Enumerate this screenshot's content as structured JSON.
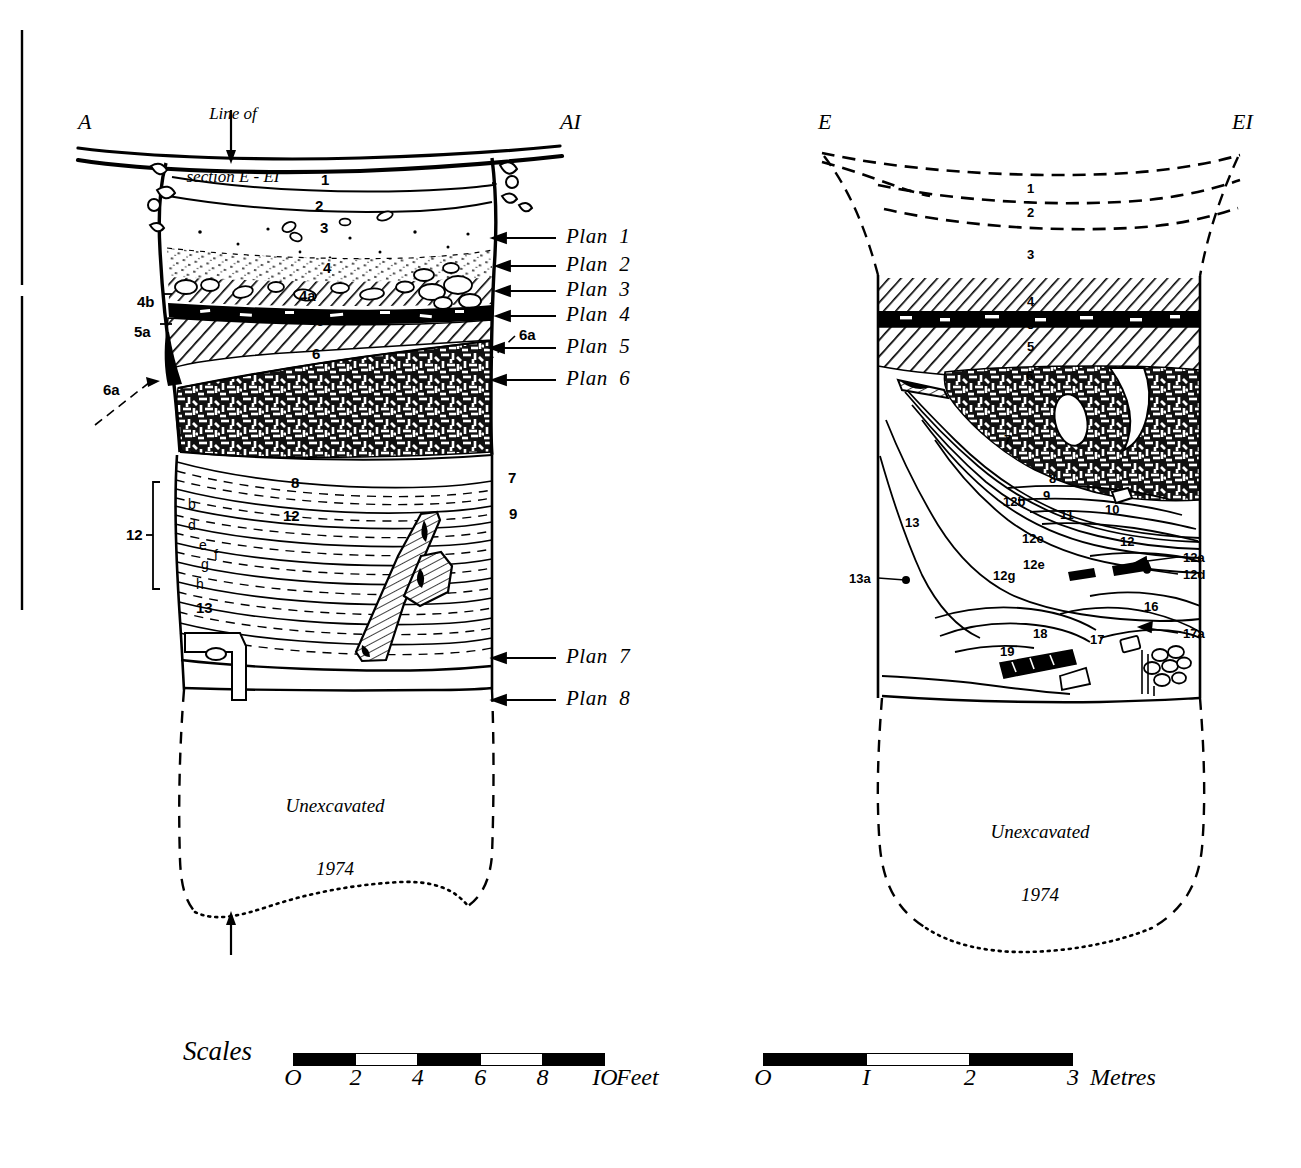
{
  "figure": {
    "title_note": "Line of\nsection E - EI",
    "line_of_section_l1": "Line of",
    "line_of_section_l2": "section E - EI"
  },
  "left_section": {
    "left_letter": "A",
    "right_letter": "AI",
    "caption_line1": "Unexcavated",
    "caption_line2": "1974",
    "bracket_label": "12",
    "strata_labels": [
      {
        "id": "l-1",
        "text": "1",
        "x": 321,
        "y": 172
      },
      {
        "id": "l-2",
        "text": "2",
        "x": 315,
        "y": 198
      },
      {
        "id": "l-3",
        "text": "3",
        "x": 320,
        "y": 220
      },
      {
        "id": "l-4",
        "text": "4",
        "x": 323,
        "y": 260
      },
      {
        "id": "l-4a",
        "text": "4a",
        "x": 299,
        "y": 288
      },
      {
        "id": "l-4b",
        "text": "4b",
        "x": 137,
        "y": 294
      },
      {
        "id": "l-5",
        "text": "5",
        "x": 316,
        "y": 313
      },
      {
        "id": "l-5a",
        "text": "5a",
        "x": 134,
        "y": 324
      },
      {
        "id": "l-6",
        "text": "6",
        "x": 312,
        "y": 346
      },
      {
        "id": "l-6a-top",
        "text": "6a",
        "x": 519,
        "y": 327
      },
      {
        "id": "l-6a-left",
        "text": "6a",
        "x": 103,
        "y": 382
      },
      {
        "id": "l-7",
        "text": "7",
        "x": 508,
        "y": 470
      },
      {
        "id": "l-8",
        "text": "8",
        "x": 291,
        "y": 475
      },
      {
        "id": "l-9",
        "text": "9",
        "x": 509,
        "y": 506
      },
      {
        "id": "l-12",
        "text": "12",
        "x": 283,
        "y": 508
      },
      {
        "id": "l-13",
        "text": "13",
        "x": 196,
        "y": 600
      }
    ],
    "sub_layers": [
      {
        "id": "sub-b",
        "text": "b",
        "x": 188,
        "y": 497
      },
      {
        "id": "sub-d",
        "text": "d",
        "x": 188,
        "y": 518
      },
      {
        "id": "sub-e",
        "text": "e",
        "x": 199,
        "y": 538
      },
      {
        "id": "sub-f",
        "text": "f",
        "x": 214,
        "y": 548
      },
      {
        "id": "sub-g",
        "text": "g",
        "x": 201,
        "y": 557
      },
      {
        "id": "sub-h",
        "text": "h",
        "x": 196,
        "y": 577
      }
    ],
    "plan_callouts": [
      {
        "id": "plan-1",
        "label": "Plan  1",
        "y": 238
      },
      {
        "id": "plan-2",
        "label": "Plan  2",
        "y": 266
      },
      {
        "id": "plan-3",
        "label": "Plan  3",
        "y": 291
      },
      {
        "id": "plan-4",
        "label": "Plan  4",
        "y": 316
      },
      {
        "id": "plan-5",
        "label": "Plan  5",
        "y": 348
      },
      {
        "id": "plan-6",
        "label": "Plan  6",
        "y": 380
      },
      {
        "id": "plan-7",
        "label": "Plan  7",
        "y": 658
      },
      {
        "id": "plan-8",
        "label": "Plan  8",
        "y": 700
      }
    ]
  },
  "right_section": {
    "left_letter": "E",
    "right_letter": "EI",
    "caption_line1": "Unexcavated",
    "caption_line2": "1974",
    "strata_labels": [
      {
        "id": "r-1",
        "text": "1",
        "x": 1027,
        "y": 182
      },
      {
        "id": "r-2",
        "text": "2",
        "x": 1027,
        "y": 206
      },
      {
        "id": "r-3",
        "text": "3",
        "x": 1027,
        "y": 248
      },
      {
        "id": "r-4",
        "text": "4",
        "x": 1027,
        "y": 295
      },
      {
        "id": "r-5a",
        "text": "5",
        "x": 1027,
        "y": 318
      },
      {
        "id": "r-5b",
        "text": "5",
        "x": 1027,
        "y": 340
      },
      {
        "id": "r-6",
        "text": "6",
        "x": 1026,
        "y": 369
      },
      {
        "id": "r-7",
        "text": "7",
        "x": 1004,
        "y": 433
      },
      {
        "id": "r-8",
        "text": "8",
        "x": 1049,
        "y": 472
      },
      {
        "id": "r-9",
        "text": "9",
        "x": 1043,
        "y": 489
      },
      {
        "id": "r-10",
        "text": "10",
        "x": 1105,
        "y": 503
      },
      {
        "id": "r-11",
        "text": "11",
        "x": 1060,
        "y": 508
      },
      {
        "id": "r-12",
        "text": "12",
        "x": 1120,
        "y": 535
      },
      {
        "id": "r-12b",
        "text": "12b",
        "x": 1003,
        "y": 495
      },
      {
        "id": "r-12e1",
        "text": "12e",
        "x": 1022,
        "y": 532
      },
      {
        "id": "r-12e2",
        "text": "12e",
        "x": 1023,
        "y": 558
      },
      {
        "id": "r-12g",
        "text": "12g",
        "x": 993,
        "y": 569
      },
      {
        "id": "r-12a",
        "text": "12a",
        "x": 1183,
        "y": 551
      },
      {
        "id": "r-12d",
        "text": "12d",
        "x": 1183,
        "y": 568
      },
      {
        "id": "r-13",
        "text": "13",
        "x": 905,
        "y": 516
      },
      {
        "id": "r-13a",
        "text": "13a",
        "x": 849,
        "y": 572
      },
      {
        "id": "r-16",
        "text": "16",
        "x": 1144,
        "y": 600
      },
      {
        "id": "r-17",
        "text": "17",
        "x": 1090,
        "y": 633
      },
      {
        "id": "r-17a",
        "text": "17a",
        "x": 1183,
        "y": 627
      },
      {
        "id": "r-18",
        "text": "18",
        "x": 1033,
        "y": 627
      },
      {
        "id": "r-19",
        "text": "19",
        "x": 1000,
        "y": 645
      }
    ]
  },
  "scales": {
    "word": "Scales",
    "feet": {
      "ticks": [
        "O",
        "2",
        "4",
        "6",
        "8",
        "IO"
      ],
      "unit": "Feet",
      "segments": [
        "black",
        "white",
        "black",
        "white",
        "black"
      ]
    },
    "metres": {
      "ticks": [
        "O",
        "I",
        "2",
        "3"
      ],
      "unit": "Metres",
      "segments": [
        "black",
        "white",
        "black"
      ]
    }
  },
  "colors": {
    "ink": "#000000",
    "paper": "#ffffff"
  }
}
